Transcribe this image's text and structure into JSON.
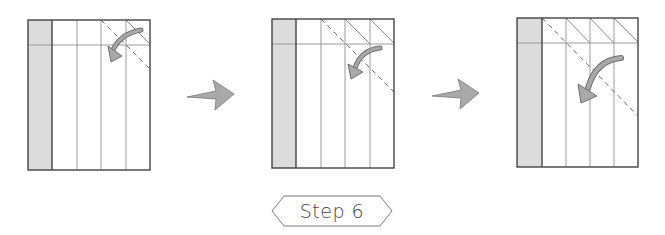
{
  "diagram": {
    "title": "Step 6",
    "colors": {
      "shaded_strip": "#dcdcdc",
      "outline": "#444444",
      "crease": "#9a9a9a",
      "arrow_fill": "#a9a9a9",
      "arrow_stroke": "#6f6f6f",
      "dashed": "#666666"
    },
    "panels": [
      {
        "id": "panel-1",
        "x": 28,
        "y": 20,
        "w": 122,
        "h": 150,
        "folded_corners": 1,
        "description": "Valley fold along dashed diagonal at top-right corner"
      },
      {
        "id": "panel-2",
        "x": 272,
        "y": 19,
        "w": 122,
        "h": 149,
        "folded_corners": 2,
        "description": "Second diagonal fold further left"
      },
      {
        "id": "panel-3",
        "x": 517,
        "y": 18,
        "w": 121,
        "h": 149,
        "folded_corners": 3,
        "description": "Third diagonal fold from the shaded strip edge"
      }
    ],
    "transition_arrows": [
      {
        "id": "arrow-1-to-2"
      },
      {
        "id": "arrow-2-to-3"
      }
    ]
  }
}
